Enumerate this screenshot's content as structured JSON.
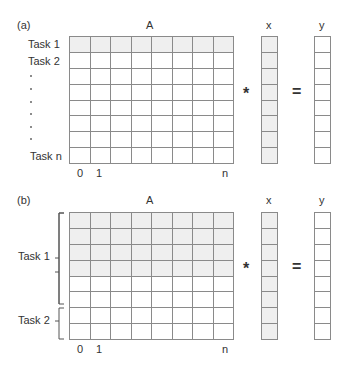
{
  "panel_a": {
    "label": "(a)",
    "matrix_label": "A",
    "vector_x_label": "x",
    "vector_y_label": "y",
    "multiply_symbol": "*",
    "equals_symbol": "=",
    "row_labels": [
      "Task 1",
      "Task 2",
      "Task n"
    ],
    "ellipsis_dots": 6,
    "col_labels": [
      "0",
      "1",
      "n"
    ],
    "rows": 8,
    "cols": 8,
    "shaded_rows": [
      0
    ],
    "x_vector_shaded": true,
    "y_vector_shaded": false
  },
  "panel_b": {
    "label": "(b)",
    "matrix_label": "A",
    "vector_x_label": "x",
    "vector_y_label": "y",
    "multiply_symbol": "*",
    "equals_symbol": "=",
    "groups": [
      {
        "label": "Task 1",
        "rows": [
          0,
          1,
          2,
          3
        ]
      },
      {
        "label": "Task 2",
        "rows": [
          4,
          5,
          6,
          7
        ]
      }
    ],
    "col_labels": [
      "0",
      "1",
      "n"
    ],
    "rows": 8,
    "cols": 8,
    "shaded_rows": [
      0,
      1,
      2,
      3
    ],
    "x_vector_shaded": true,
    "y_vector_shaded": false
  },
  "colors": {
    "grid_line": "#8a8a8a",
    "shaded_cell": "#efefef",
    "text": "#333333"
  }
}
